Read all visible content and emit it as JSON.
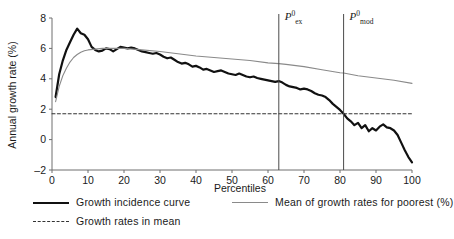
{
  "chart_data": {
    "type": "line",
    "title": "",
    "xlabel": "Percentiles",
    "ylabel": "Annual growth rate (%)",
    "xlim": [
      0,
      100
    ],
    "ylim": [
      -2,
      8
    ],
    "xticks": [
      0,
      10,
      20,
      30,
      40,
      50,
      60,
      70,
      80,
      90,
      100
    ],
    "yticks": [
      -2,
      0,
      2,
      4,
      6,
      8
    ],
    "grid": false,
    "legend_position": "below-axes",
    "series": [
      {
        "name": "Growth incidence curve",
        "style": "solid",
        "color": "#111111",
        "width": 2.2,
        "x": [
          1,
          2,
          3,
          4,
          5,
          6,
          7,
          8,
          9,
          10,
          11,
          12,
          13,
          14,
          15,
          16,
          17,
          18,
          19,
          20,
          21,
          22,
          23,
          24,
          25,
          26,
          27,
          28,
          29,
          30,
          31,
          32,
          33,
          34,
          35,
          36,
          37,
          38,
          39,
          40,
          41,
          42,
          43,
          44,
          45,
          46,
          47,
          48,
          49,
          50,
          51,
          52,
          53,
          54,
          55,
          56,
          57,
          58,
          59,
          60,
          61,
          62,
          63,
          64,
          65,
          66,
          67,
          68,
          69,
          70,
          71,
          72,
          73,
          74,
          75,
          76,
          77,
          78,
          79,
          80,
          81,
          82,
          83,
          84,
          85,
          86,
          87,
          88,
          89,
          90,
          91,
          92,
          93,
          94,
          95,
          96,
          97,
          98,
          99,
          100
        ],
        "y": [
          2.8,
          4.3,
          5.2,
          5.9,
          6.4,
          6.9,
          7.3,
          7.0,
          6.9,
          6.6,
          6.1,
          5.9,
          5.8,
          5.85,
          6.0,
          5.95,
          5.8,
          5.95,
          6.1,
          6.05,
          6.0,
          6.05,
          6.0,
          5.9,
          5.8,
          5.75,
          5.7,
          5.65,
          5.7,
          5.6,
          5.45,
          5.35,
          5.4,
          5.25,
          5.1,
          5.0,
          5.05,
          4.95,
          4.8,
          4.85,
          4.75,
          4.6,
          4.65,
          4.55,
          4.45,
          4.5,
          4.55,
          4.45,
          4.35,
          4.3,
          4.25,
          4.35,
          4.25,
          4.15,
          4.1,
          4.15,
          4.05,
          4.0,
          3.95,
          3.9,
          3.85,
          3.8,
          3.85,
          3.75,
          3.6,
          3.5,
          3.45,
          3.4,
          3.3,
          3.35,
          3.3,
          3.2,
          3.05,
          2.95,
          2.9,
          2.8,
          2.6,
          2.35,
          2.15,
          1.95,
          1.7,
          1.4,
          1.2,
          0.95,
          1.1,
          0.75,
          0.95,
          0.55,
          0.75,
          0.6,
          0.85,
          1.0,
          0.8,
          0.75,
          0.6,
          0.3,
          -0.2,
          -0.7,
          -1.15,
          -1.5
        ]
      },
      {
        "name": "Mean of growth rates for poorest (%)",
        "style": "solid",
        "color": "#8a8a8a",
        "width": 1.1,
        "x": [
          1,
          2,
          3,
          4,
          5,
          6,
          7,
          8,
          9,
          10,
          12,
          14,
          16,
          18,
          20,
          25,
          30,
          35,
          40,
          45,
          50,
          55,
          60,
          63,
          65,
          70,
          75,
          80,
          81,
          85,
          90,
          95,
          100
        ],
        "y": [
          2.5,
          3.5,
          4.2,
          4.7,
          5.1,
          5.4,
          5.6,
          5.75,
          5.85,
          5.9,
          5.95,
          6.0,
          6.0,
          6.0,
          6.0,
          5.9,
          5.8,
          5.65,
          5.5,
          5.4,
          5.3,
          5.2,
          5.05,
          5.0,
          4.95,
          4.8,
          4.6,
          4.4,
          4.38,
          4.2,
          4.05,
          3.9,
          3.7
        ]
      },
      {
        "name": "Growth rates in mean",
        "style": "dashed",
        "color": "#333333",
        "width": 1.1,
        "constant_y": 1.7,
        "x": [
          0,
          100
        ],
        "y": [
          1.7,
          1.7
        ]
      }
    ],
    "annotations": [
      {
        "name": "vline-p-ex",
        "label": "P",
        "superscript": "0",
        "subscript": "ex",
        "x": 63,
        "type": "vertical-line"
      },
      {
        "name": "vline-p-mod",
        "label": "P",
        "superscript": "0",
        "subscript": "mod",
        "x": 81,
        "type": "vertical-line"
      }
    ]
  },
  "axes": {
    "ylabel": "Annual growth rate (%)",
    "xlabel": "Percentiles",
    "yticklabels": [
      "8",
      "6",
      "4",
      "2",
      "0",
      "-2"
    ],
    "xticklabels": [
      "0",
      "10",
      "20",
      "30",
      "40",
      "50",
      "60",
      "70",
      "80",
      "90",
      "100"
    ]
  },
  "annotations": {
    "p_ex": {
      "base": "P",
      "sup": "0",
      "sub": "ex"
    },
    "p_mod": {
      "base": "P",
      "sup": "0",
      "sub": "mod"
    }
  },
  "legend": {
    "items": [
      {
        "label": "Growth incidence curve",
        "style": "solid-black"
      },
      {
        "label": "Growth rates in mean",
        "style": "dashed-black"
      },
      {
        "label": "Mean of growth rates for poorest (%)",
        "style": "solid-gray"
      }
    ]
  },
  "colors": {
    "gic": "#111111",
    "mean_poorest": "#8a8a8a",
    "growth_in_mean": "#333333",
    "axis": "#6e6e6e",
    "background": "#ffffff"
  }
}
